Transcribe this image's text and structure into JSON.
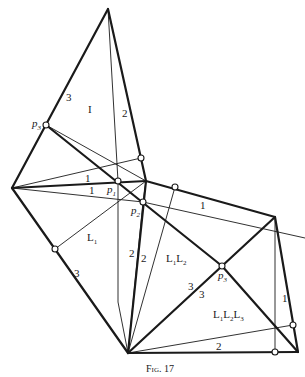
{
  "figure": {
    "caption": "Fig. 17"
  },
  "vertices": {
    "A": [
      108,
      9
    ],
    "B": [
      12,
      188
    ],
    "C": [
      128,
      353
    ],
    "D": [
      146,
      181
    ],
    "E": [
      275,
      217
    ],
    "F": [
      298,
      352
    ]
  },
  "points": {
    "p3_left": {
      "label": "p",
      "sub": "3",
      "pos": [
        46,
        125
      ]
    },
    "p1": {
      "label": "p",
      "sub": "1",
      "pos": [
        118,
        181
      ]
    },
    "p2": {
      "label": "p",
      "sub": "2",
      "pos": [
        143,
        202
      ]
    },
    "p3_right": {
      "label": "p",
      "sub": "3",
      "pos": [
        222,
        266
      ]
    }
  },
  "region_labels": {
    "I": "I",
    "L1": {
      "main": "L",
      "sub": "1"
    },
    "L1L2": {
      "parts": [
        "L",
        "1",
        "L",
        "2"
      ]
    },
    "L1L2L3": {
      "parts": [
        "L",
        "1",
        "L",
        "2",
        "L",
        "3"
      ]
    }
  },
  "edge_labels": [
    "3",
    "2",
    "1",
    "1",
    "1",
    "3",
    "2",
    "2",
    "3",
    "3",
    "1",
    "2"
  ]
}
